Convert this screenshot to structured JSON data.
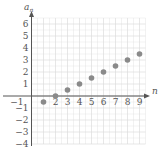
{
  "chart_data": {
    "type": "scatter",
    "title": "",
    "xlabel": "n",
    "ylabel": "a_n",
    "ylabel_main": "a",
    "ylabel_sub": "n",
    "x": [
      1,
      2,
      3,
      4,
      5,
      6,
      7,
      8,
      9
    ],
    "y": [
      -0.5,
      0,
      0.5,
      1,
      1.5,
      2,
      2.5,
      3,
      3.5
    ],
    "xlim": [
      -1,
      9.5
    ],
    "ylim": [
      -4,
      6.5
    ],
    "x_ticks": [
      -1,
      2,
      3,
      4,
      5,
      6,
      7,
      8,
      9
    ],
    "x_tick_labels": [
      "−1",
      "2",
      "3",
      "4",
      "5",
      "6",
      "7",
      "8",
      "9"
    ],
    "y_ticks": [
      6,
      5,
      4,
      3,
      2,
      1,
      -1,
      -2,
      -3,
      -4
    ],
    "y_tick_labels": [
      "6",
      "5",
      "4",
      "3",
      "2",
      "1",
      "−1",
      "−2",
      "−3",
      "−4"
    ],
    "grid": true,
    "legend": null,
    "colors": {
      "point": "#8a8a8a",
      "axis": "#555555",
      "grid": "#dddddd"
    }
  }
}
